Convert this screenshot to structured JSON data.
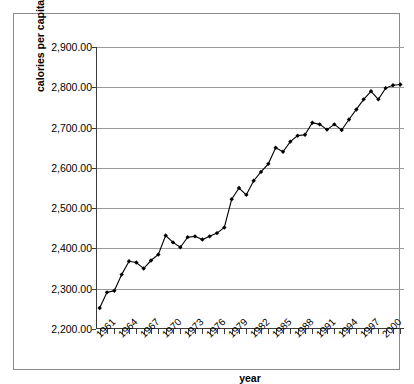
{
  "chart_data": {
    "type": "line",
    "title": "",
    "xlabel": "year",
    "ylabel": "calories per capita per day",
    "ylim": [
      2200,
      2900
    ],
    "ytick_step": 100,
    "ytick_labels": [
      "2,900.00",
      "2,800.00",
      "2,700.00",
      "2,600.00",
      "2,500.00",
      "2,400.00",
      "2,300.00",
      "2,200.00"
    ],
    "ytick_values": [
      2900,
      2800,
      2700,
      2600,
      2500,
      2400,
      2300,
      2200
    ],
    "grid": true,
    "legend": false,
    "marker": "diamond",
    "line_color": "#000000",
    "marker_color": "#000000",
    "grid_color": "#9a9a9a",
    "xtick_label_rotation": -45,
    "xtick_label_interval": 3,
    "xtick_labels": [
      "1961",
      "1964",
      "1967",
      "1970",
      "1973",
      "1976",
      "1979",
      "1982",
      "1985",
      "1988",
      "1991",
      "1994",
      "1997",
      "2000"
    ],
    "x": [
      1961,
      1962,
      1963,
      1964,
      1965,
      1966,
      1967,
      1968,
      1969,
      1970,
      1971,
      1972,
      1973,
      1974,
      1975,
      1976,
      1977,
      1978,
      1979,
      1980,
      1981,
      1982,
      1983,
      1984,
      1985,
      1986,
      1987,
      1988,
      1989,
      1990,
      1991,
      1992,
      1993,
      1994,
      1995,
      1996,
      1997,
      1998,
      1999,
      2000,
      2001,
      2002
    ],
    "values": [
      2252,
      2291,
      2295,
      2335,
      2368,
      2365,
      2350,
      2370,
      2385,
      2432,
      2415,
      2403,
      2428,
      2430,
      2422,
      2430,
      2438,
      2452,
      2522,
      2550,
      2533,
      2568,
      2590,
      2610,
      2650,
      2640,
      2665,
      2680,
      2682,
      2712,
      2708,
      2695,
      2708,
      2694,
      2720,
      2745,
      2770,
      2790,
      2770,
      2798,
      2805,
      2807
    ],
    "series": [
      {
        "name": "calories per capita per day",
        "values": [
          2252,
          2291,
          2295,
          2335,
          2368,
          2365,
          2350,
          2370,
          2385,
          2432,
          2415,
          2403,
          2428,
          2430,
          2422,
          2430,
          2438,
          2452,
          2522,
          2550,
          2533,
          2568,
          2590,
          2610,
          2650,
          2640,
          2665,
          2680,
          2682,
          2712,
          2708,
          2695,
          2708,
          2694,
          2720,
          2745,
          2770,
          2790,
          2770,
          2798,
          2805,
          2807
        ]
      }
    ]
  }
}
